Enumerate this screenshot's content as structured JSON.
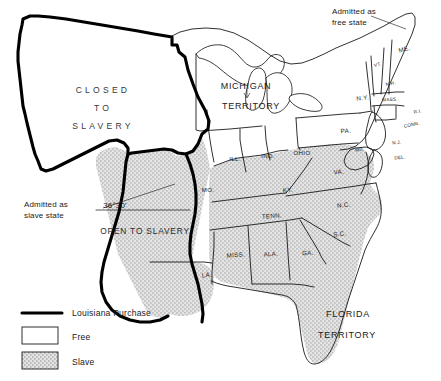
{
  "map": {
    "title": "Missouri Compromise 1820",
    "regions": [
      {
        "name": "closed-to-slavery",
        "label_lines": [
          "CLOSED",
          "TO",
          "SLAVERY"
        ],
        "status": "free"
      },
      {
        "name": "open-to-slavery",
        "label": "OPEN TO SLAVERY",
        "status": "slave"
      }
    ],
    "compromise_line": {
      "label": "36°30'"
    },
    "annotations": [
      {
        "name": "maine-annotation",
        "lines": [
          "Admitted as",
          "free state"
        ],
        "target": "ME."
      },
      {
        "name": "missouri-annotation",
        "lines": [
          "Admitted as",
          "slave state"
        ],
        "target": "MO."
      }
    ],
    "territories": [
      {
        "name": "michigan-territory",
        "lines": [
          "MICHIGAN",
          "TERRITORY"
        ]
      },
      {
        "name": "florida-territory",
        "lines": [
          "FLORIDA",
          "TERRITORY"
        ]
      }
    ],
    "states": {
      "free": [
        {
          "abbr": "ME."
        },
        {
          "abbr": "VT."
        },
        {
          "abbr": "N.H."
        },
        {
          "abbr": "MASS."
        },
        {
          "abbr": "R.I."
        },
        {
          "abbr": "CONN."
        },
        {
          "abbr": "N.Y."
        },
        {
          "abbr": "N.J."
        },
        {
          "abbr": "PA."
        },
        {
          "abbr": "OHIO"
        },
        {
          "abbr": "IND."
        },
        {
          "abbr": "ILL."
        }
      ],
      "slave": [
        {
          "abbr": "MO."
        },
        {
          "abbr": "LA."
        },
        {
          "abbr": "MISS."
        },
        {
          "abbr": "ALA."
        },
        {
          "abbr": "GA."
        },
        {
          "abbr": "S.C."
        },
        {
          "abbr": "N.C."
        },
        {
          "abbr": "TENN."
        },
        {
          "abbr": "KY."
        },
        {
          "abbr": "VA."
        },
        {
          "abbr": "MD."
        },
        {
          "abbr": "DEL."
        }
      ]
    }
  },
  "legend": {
    "items": [
      {
        "name": "louisiana-purchase",
        "label": "Louisiana Purchase",
        "swatch": "thick-line"
      },
      {
        "name": "free",
        "label": "Free",
        "swatch": "white-box"
      },
      {
        "name": "slave",
        "label": "Slave",
        "swatch": "stipple-box"
      }
    ]
  },
  "colors": {
    "ink": "#1a1a1a",
    "purchase_line": "#000000",
    "free_fill": "#ffffff",
    "slave_fill": "#d8d8d8",
    "background": "#ffffff"
  }
}
